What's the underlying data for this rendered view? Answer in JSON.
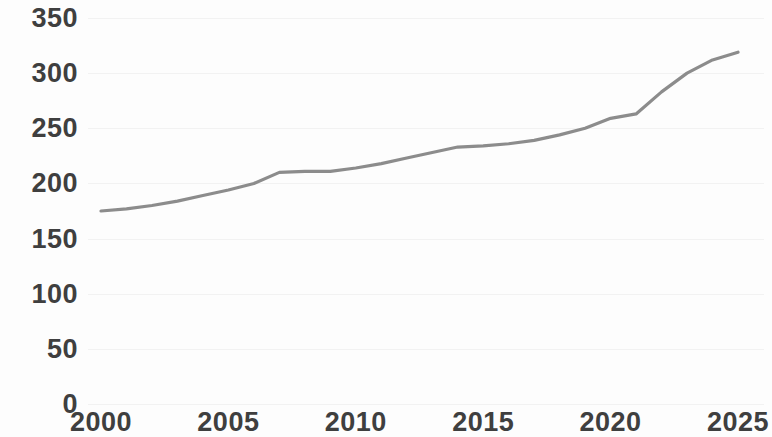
{
  "chart_data": {
    "type": "line",
    "title": "",
    "subtitle": "",
    "xlabel": "",
    "ylabel": "",
    "xlim": [
      2000,
      2025
    ],
    "ylim": [
      0,
      350
    ],
    "grid": true,
    "legend": false,
    "legend_position": "none",
    "line_color": "#8c8c8c",
    "label_color": "#3f3f3f",
    "background_color": "#fdfdfd",
    "ytick_labels": [
      "0",
      "50",
      "100",
      "150",
      "200",
      "250",
      "300",
      "350"
    ],
    "ytick_values": [
      0,
      50,
      100,
      150,
      200,
      250,
      300,
      350
    ],
    "xtick_labels": [
      "2000",
      "2005",
      "2010",
      "2015",
      "2020",
      "2025"
    ],
    "xtick_values": [
      2000,
      2005,
      2010,
      2015,
      2020,
      2025
    ],
    "x": [
      2000,
      2001,
      2002,
      2003,
      2004,
      2005,
      2006,
      2007,
      2008,
      2009,
      2010,
      2011,
      2012,
      2013,
      2014,
      2015,
      2016,
      2017,
      2018,
      2019,
      2020,
      2021,
      2022,
      2023,
      2024,
      2025
    ],
    "values": [
      175,
      177,
      180,
      184,
      189,
      194,
      200,
      210,
      211,
      211,
      214,
      218,
      223,
      228,
      233,
      234,
      236,
      239,
      244,
      250,
      259,
      263,
      283,
      300,
      312,
      319
    ],
    "series": [
      {
        "name": "",
        "color": "#8c8c8c",
        "values": [
          175,
          177,
          180,
          184,
          189,
          194,
          200,
          210,
          211,
          211,
          214,
          218,
          223,
          228,
          233,
          234,
          236,
          239,
          244,
          250,
          259,
          263,
          283,
          300,
          312,
          319
        ]
      }
    ]
  }
}
